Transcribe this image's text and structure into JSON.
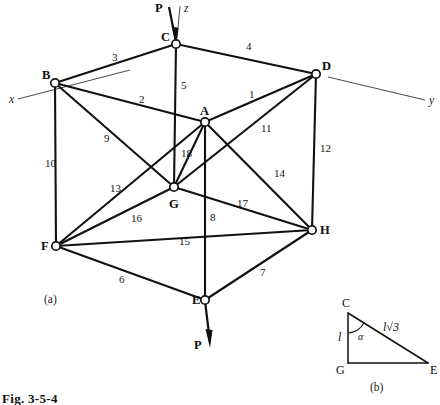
{
  "figure": {
    "caption": "Fig. 3-5-4",
    "part_a_label": "(a)",
    "part_b_label": "(b)"
  },
  "axes": [
    {
      "name": "x",
      "label": "x"
    },
    {
      "name": "y",
      "label": "y"
    },
    {
      "name": "z",
      "label": "z"
    }
  ],
  "loads": [
    {
      "name": "load-top",
      "label": "P",
      "at_joint": "C",
      "direction": "down"
    },
    {
      "name": "load-bottom",
      "label": "P",
      "at_joint": "E",
      "direction": "down"
    }
  ],
  "joints": [
    {
      "id": "A",
      "label": "A",
      "x": 205,
      "y": 122,
      "label_x": 200,
      "label_y": 105
    },
    {
      "id": "B",
      "label": "B",
      "x": 55,
      "y": 83,
      "label_x": 42,
      "label_y": 69
    },
    {
      "id": "C",
      "label": "C",
      "x": 176,
      "y": 44,
      "label_x": 161,
      "label_y": 31
    },
    {
      "id": "D",
      "label": "D",
      "x": 316,
      "y": 74,
      "label_x": 322,
      "label_y": 60
    },
    {
      "id": "E",
      "label": "E",
      "x": 205,
      "y": 300,
      "label_x": 192,
      "label_y": 294
    },
    {
      "id": "F",
      "label": "F",
      "x": 56,
      "y": 246,
      "label_x": 41,
      "label_y": 240
    },
    {
      "id": "G",
      "label": "G",
      "x": 174,
      "y": 187,
      "label_x": 169,
      "label_y": 198
    },
    {
      "id": "H",
      "label": "H",
      "x": 312,
      "y": 230,
      "label_x": 320,
      "label_y": 224
    }
  ],
  "members": [
    {
      "id": "1",
      "label": "1",
      "from": "A",
      "to": "D",
      "label_x": 249,
      "label_y": 89
    },
    {
      "id": "2",
      "label": "2",
      "from": "B",
      "to": "A",
      "label_x": 139,
      "label_y": 94
    },
    {
      "id": "3",
      "label": "3",
      "from": "B",
      "to": "C",
      "label_x": 112,
      "label_y": 52
    },
    {
      "id": "4",
      "label": "4",
      "from": "C",
      "to": "D",
      "label_x": 246,
      "label_y": 41
    },
    {
      "id": "5",
      "label": "5",
      "from": "C",
      "to": "G",
      "label_x": 181,
      "label_y": 80
    },
    {
      "id": "6",
      "label": "6",
      "from": "F",
      "to": "E",
      "label_x": 119,
      "label_y": 274
    },
    {
      "id": "7",
      "label": "7",
      "from": "E",
      "to": "H",
      "label_x": 260,
      "label_y": 267
    },
    {
      "id": "8",
      "label": "8",
      "from": "A",
      "to": "E",
      "label_x": 210,
      "label_y": 212
    },
    {
      "id": "9",
      "label": "9",
      "from": "B",
      "to": "G",
      "label_x": 104,
      "label_y": 133
    },
    {
      "id": "10",
      "label": "10",
      "from": "B",
      "to": "F",
      "label_x": 45,
      "label_y": 158
    },
    {
      "id": "11",
      "label": "11",
      "from": "A",
      "to": "H",
      "label_x": 261,
      "label_y": 123
    },
    {
      "id": "12",
      "label": "12",
      "from": "D",
      "to": "H",
      "label_x": 320,
      "label_y": 143
    },
    {
      "id": "13",
      "label": "13",
      "from": "F",
      "to": "G",
      "label_x": 110,
      "label_y": 183
    },
    {
      "id": "14",
      "label": "14",
      "from": "D",
      "to": "G",
      "label_x": 274,
      "label_y": 168
    },
    {
      "id": "15",
      "label": "15",
      "from": "F",
      "to": "H",
      "label_x": 179,
      "label_y": 236
    },
    {
      "id": "16",
      "label": "16",
      "from": "F",
      "to": "A",
      "label_x": 131,
      "label_y": 213
    },
    {
      "id": "17",
      "label": "17",
      "from": "G",
      "to": "H",
      "label_x": 237,
      "label_y": 198
    },
    {
      "id": "18",
      "label": "18",
      "from": "A",
      "to": "G",
      "label_x": 181,
      "label_y": 148
    }
  ],
  "inset": {
    "vertices": [
      {
        "id": "C",
        "label": "C",
        "x": 348,
        "y": 313,
        "label_x": 342,
        "label_y": 298
      },
      {
        "id": "G",
        "label": "G",
        "x": 348,
        "y": 363,
        "label_x": 337,
        "label_y": 364
      },
      {
        "id": "E",
        "label": "E",
        "x": 428,
        "y": 363,
        "label_x": 429,
        "label_y": 364
      }
    ],
    "side_vertical_label": "l",
    "side_hypotenuse_label": "l√3",
    "angle_label": "α"
  }
}
